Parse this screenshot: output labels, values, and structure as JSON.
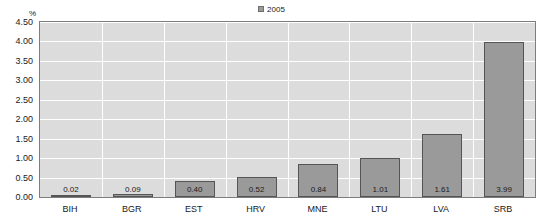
{
  "legend": {
    "position": "top-center",
    "entries": [
      {
        "label": "2005",
        "color": "#9a9a9a"
      }
    ]
  },
  "axis": {
    "unit_label": "%",
    "y_ticks": [
      "0.00",
      "0.50",
      "1.00",
      "1.50",
      "2.00",
      "2.50",
      "3.00",
      "3.50",
      "4.00",
      "4.50"
    ]
  },
  "colors": {
    "bar_fill": "#9a9a9a",
    "bar_border": "#555555",
    "plot_background": "#dcdcdc",
    "gridline": "#ffffff",
    "plot_border": "#7d7d7d",
    "text": "#1a1a1a"
  },
  "chart_data": {
    "type": "bar",
    "title": "",
    "xlabel": "",
    "ylabel": "%",
    "ylim": [
      0,
      4.5
    ],
    "ytick_step": 0.5,
    "grid": true,
    "legend_position": "top-center",
    "categories": [
      "BIH",
      "BGR",
      "EST",
      "HRV",
      "MNE",
      "LTU",
      "LVA",
      "SRB"
    ],
    "series": [
      {
        "name": "2005",
        "color": "#9a9a9a",
        "values": [
          0.02,
          0.09,
          0.4,
          0.52,
          0.84,
          1.01,
          1.61,
          3.99
        ],
        "labels": [
          "0.02",
          "0.09",
          "0.40",
          "0.52",
          "0.84",
          "1.01",
          "1.61",
          "3.99"
        ]
      }
    ]
  }
}
